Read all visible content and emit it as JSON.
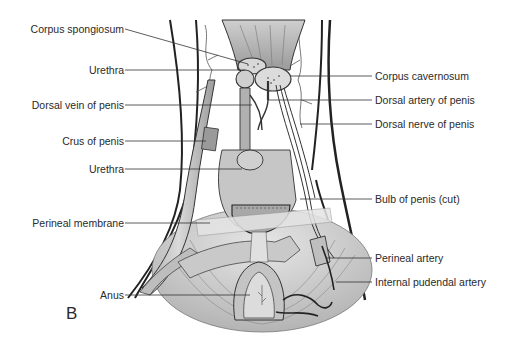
{
  "figure": {
    "panel_letter": "B",
    "labels_left": [
      {
        "id": "corpus-spongiosum",
        "text": "Corpus spongiosum"
      },
      {
        "id": "urethra-upper",
        "text": "Urethra"
      },
      {
        "id": "dorsal-vein-of-penis",
        "text": "Dorsal vein of penis"
      },
      {
        "id": "crus-of-penis",
        "text": "Crus of penis"
      },
      {
        "id": "urethra-lower",
        "text": "Urethra"
      },
      {
        "id": "perineal-membrane",
        "text": "Perineal membrane"
      },
      {
        "id": "anus",
        "text": "Anus"
      }
    ],
    "labels_right": [
      {
        "id": "corpus-cavernosum",
        "text": "Corpus cavernosum"
      },
      {
        "id": "dorsal-artery-of-penis",
        "text": "Dorsal artery of penis"
      },
      {
        "id": "dorsal-nerve-of-penis",
        "text": "Dorsal nerve of penis"
      },
      {
        "id": "bulb-of-penis-cut",
        "text": "Bulb of penis (cut)"
      },
      {
        "id": "perineal-artery",
        "text": "Perineal artery"
      },
      {
        "id": "internal-pudendal-artery",
        "text": "Internal pudendal artery"
      }
    ],
    "colors": {
      "ink": "#2a2a2a",
      "tissue_light": "#d9d9d9",
      "tissue_mid": "#b5b5b5",
      "tissue_dark": "#8a8a8a",
      "background": "#ffffff"
    }
  }
}
